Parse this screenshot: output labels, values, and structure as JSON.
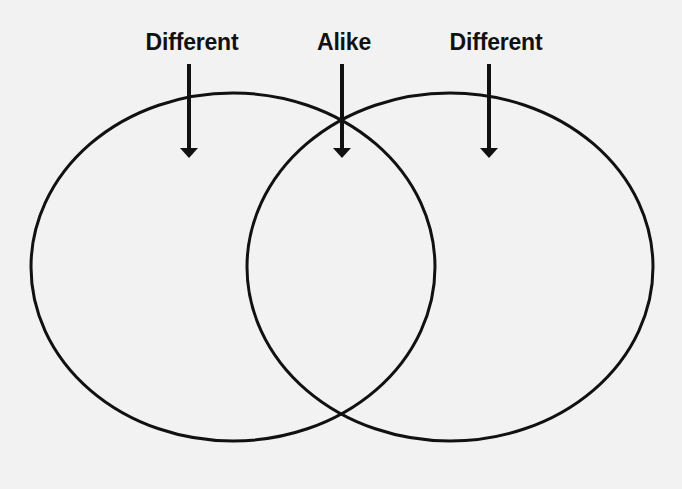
{
  "diagram": {
    "type": "venn",
    "labels": {
      "left": "Different",
      "center": "Alike",
      "right": "Different"
    },
    "regions": [
      {
        "name": "left-only",
        "label": "Different"
      },
      {
        "name": "intersection",
        "label": "Alike"
      },
      {
        "name": "right-only",
        "label": "Different"
      }
    ],
    "colors": {
      "stroke": "#111111",
      "background": "#f2f2f2"
    }
  }
}
